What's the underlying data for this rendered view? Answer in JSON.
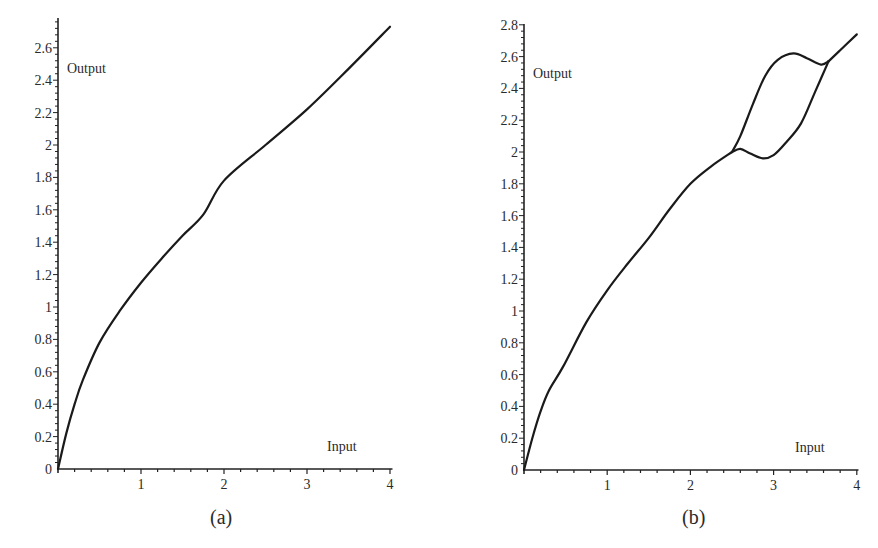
{
  "figure": {
    "panels": [
      {
        "caption": "(a)",
        "ylabel": "Output",
        "xlabel": "Input"
      },
      {
        "caption": "(b)",
        "ylabel": "Output",
        "xlabel": "Input"
      }
    ]
  },
  "chart_data": [
    {
      "type": "line",
      "title": "(a)",
      "xlabel": "Input",
      "ylabel": "Output",
      "xlim": [
        0,
        4
      ],
      "ylim": [
        0,
        2.7
      ],
      "xticks": [
        1,
        2,
        3,
        4
      ],
      "yticks": [
        0,
        0.2,
        0.4,
        0.6,
        0.8,
        1,
        1.2,
        1.4,
        1.6,
        1.8,
        2,
        2.2,
        2.4,
        2.6
      ],
      "ytick_labels": [
        "0",
        "0.2",
        "0.4",
        "0.6",
        "0.8",
        "1",
        "1.2",
        "1.4",
        "1.6",
        "1.8",
        "2",
        "2.2",
        "2.4",
        "2.6"
      ],
      "grid": false,
      "series": [
        {
          "name": "Output",
          "x": [
            0,
            0.1,
            0.2,
            0.3,
            0.5,
            0.75,
            1.0,
            1.25,
            1.5,
            1.75,
            2.0,
            2.5,
            3.0,
            3.5,
            4.0
          ],
          "y": [
            0,
            0.22,
            0.4,
            0.55,
            0.78,
            0.98,
            1.15,
            1.3,
            1.44,
            1.57,
            1.78,
            2.0,
            2.22,
            2.47,
            2.73
          ]
        }
      ]
    },
    {
      "type": "line",
      "title": "(b)",
      "xlabel": "Input",
      "ylabel": "Output",
      "xlim": [
        0,
        4
      ],
      "ylim": [
        0,
        2.8
      ],
      "xticks": [
        1,
        2,
        3,
        4
      ],
      "yticks": [
        0,
        0.2,
        0.4,
        0.6,
        0.8,
        1,
        1.2,
        1.4,
        1.6,
        1.8,
        2,
        2.2,
        2.4,
        2.6,
        2.8
      ],
      "ytick_labels": [
        "0",
        "0.2",
        "0.4",
        "0.6",
        "0.8",
        "1",
        "1.2",
        "1.4",
        "1.6",
        "1.8",
        "2",
        "2.2",
        "2.4",
        "2.6",
        "2.8"
      ],
      "grid": false,
      "series": [
        {
          "name": "Output (main branch)",
          "x": [
            0,
            0.1,
            0.2,
            0.3,
            0.47,
            0.75,
            1.0,
            1.25,
            1.5,
            1.75,
            2.0,
            2.25,
            2.5
          ],
          "y": [
            0,
            0.2,
            0.37,
            0.5,
            0.65,
            0.93,
            1.13,
            1.3,
            1.46,
            1.64,
            1.8,
            1.91,
            2.0
          ]
        },
        {
          "name": "Output (lower branch)",
          "x": [
            2.5,
            2.6,
            2.72,
            2.87,
            3.0,
            3.15,
            3.33,
            3.5,
            3.66
          ],
          "y": [
            2.0,
            2.02,
            1.99,
            1.96,
            1.98,
            2.06,
            2.18,
            2.38,
            2.57
          ]
        },
        {
          "name": "Output (upper branch)",
          "x": [
            2.5,
            2.6,
            2.75,
            2.9,
            3.05,
            3.24,
            3.4,
            3.57,
            3.66
          ],
          "y": [
            2.0,
            2.1,
            2.3,
            2.48,
            2.58,
            2.62,
            2.59,
            2.55,
            2.57
          ]
        },
        {
          "name": "Output (merged)",
          "x": [
            3.66,
            3.8,
            4.0
          ],
          "y": [
            2.57,
            2.64,
            2.74
          ]
        }
      ]
    }
  ]
}
